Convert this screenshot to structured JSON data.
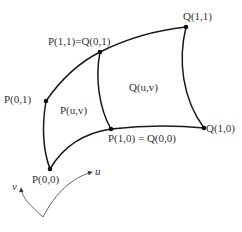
{
  "diagram": {
    "type": "bicubic surface patch composition",
    "colors": {
      "curve": "#1a1a1a",
      "axis": "#555555",
      "text": "#333333",
      "background": "#ffffff"
    },
    "points": [
      {
        "id": "p11_q01",
        "label": "P(1,1)=Q(0,1)",
        "x": 100,
        "y": 52
      },
      {
        "id": "q11",
        "label": "Q(1,1)",
        "x": 186,
        "y": 27
      },
      {
        "id": "p01",
        "label": "P(0,1)",
        "x": 46,
        "y": 101
      },
      {
        "id": "p00",
        "label": "P(0,0)",
        "x": 50,
        "y": 169
      },
      {
        "id": "p10_q00",
        "label": "P(1,0) = Q(0,0)",
        "x": 111,
        "y": 129
      },
      {
        "id": "q10",
        "label": "Q(1,0)",
        "x": 204,
        "y": 128
      }
    ],
    "patch_labels": {
      "p": "P(u,v)",
      "q": "Q(u,v)"
    },
    "axes": {
      "u_label": "u",
      "v_label": "v"
    }
  }
}
